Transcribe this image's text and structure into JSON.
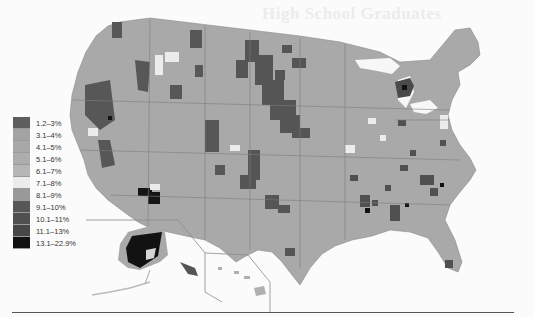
{
  "title": "High School Graduates",
  "legend": {
    "items": [
      {
        "label": "1.2–3%",
        "color": "#5e5e5e"
      },
      {
        "label": "3.1–4%",
        "color": "#a3a3a3"
      },
      {
        "label": "4.1–5%",
        "color": "#a8a8a8"
      },
      {
        "label": "5.1–6%",
        "color": "#adadad"
      },
      {
        "label": "6.1–7%",
        "color": "#b6b6b6"
      },
      {
        "label": "7.1–8%",
        "color": "#ececec"
      },
      {
        "label": "8.1–9%",
        "color": "#999999"
      },
      {
        "label": "9.1–10%",
        "color": "#575757"
      },
      {
        "label": "10.1–11%",
        "color": "#505050"
      },
      {
        "label": "11.1–13%",
        "color": "#474747"
      },
      {
        "label": "13.1–22.9%",
        "color": "#121212"
      }
    ]
  },
  "regions": {
    "inset_alaska": "Alaska",
    "inset_hawaii": "Hawaii"
  }
}
